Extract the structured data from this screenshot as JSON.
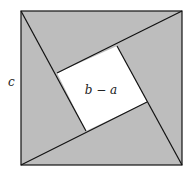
{
  "diagram": {
    "type": "pythagorean-proof-square",
    "colors": {
      "triangle_fill": "#bdbdbd",
      "inner_square_fill": "#ffffff",
      "stroke": "#111111"
    },
    "outer_square": {
      "x1": 21,
      "y1": 11,
      "x2": 182,
      "y2": 165
    },
    "inner_square": {
      "top": [
        117,
        46
      ],
      "right": [
        147,
        102
      ],
      "bottom": [
        86,
        131
      ],
      "left": [
        57,
        73
      ]
    },
    "labels": {
      "side": "c",
      "inner": "b − a"
    }
  }
}
